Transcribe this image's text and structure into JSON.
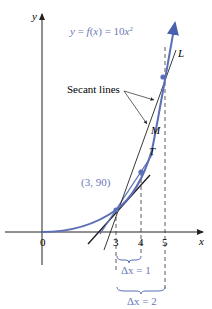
{
  "figure": {
    "equation_label": "y = f(x) = 10x²",
    "secant_label": "Secant lines",
    "point_label": "(3, 90)",
    "line_labels": {
      "L": "L",
      "M": "M",
      "T": "T"
    },
    "axes": {
      "x_label": "x",
      "y_label": "y",
      "origin_label": "0",
      "x_ticks": [
        "3",
        "4",
        "5"
      ]
    },
    "delta_labels": {
      "dx1": "Δx = 1",
      "dx2": "Δx = 2"
    }
  },
  "colors": {
    "curve": "#5b6fb8",
    "highlight_text": "#6a78b8",
    "axis": "#222222",
    "tangent": "#1a1a1a"
  }
}
